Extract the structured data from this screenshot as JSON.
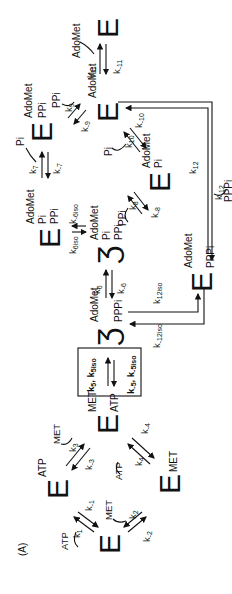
{
  "figure": {
    "panel_label": "(A)",
    "orientation": "rotated 90° counter-clockwise",
    "species": {
      "E_free": {
        "symbol": "E",
        "bound": []
      },
      "E_ATP": {
        "symbol": "E",
        "bound": [
          "ATP"
        ]
      },
      "E_MET": {
        "symbol": "E",
        "bound": [
          "MET"
        ]
      },
      "E_MET_ATP": {
        "symbol": "E",
        "bound": [
          "MET",
          "ATP"
        ]
      },
      "E_iso_AdoMet_PPPi": {
        "symbol": "Ʒ",
        "bound": [
          "AdoMet",
          "PPPi"
        ]
      },
      "E_AdoMet_PPPi": {
        "symbol": "E",
        "bound": [
          "AdoMet",
          "PPPi"
        ]
      },
      "E_AdoMet_Pi_PPi": {
        "symbol": "E",
        "bound": [
          "AdoMet",
          "Pi",
          "PPi"
        ]
      },
      "E_iso_AdoMet_Pi_PPi": {
        "symbol": "Ʒ",
        "bound": [
          "AdoMet",
          "Pi",
          "PPi"
        ]
      },
      "E_AdoMet_PPi": {
        "symbol": "E",
        "bound": [
          "AdoMet",
          "PPi"
        ]
      },
      "E_AdoMet_Pi": {
        "symbol": "E",
        "bound": [
          "AdoMet",
          "Pi"
        ]
      },
      "E_AdoMet": {
        "symbol": "E",
        "bound": [
          "AdoMet"
        ]
      },
      "E_final": {
        "symbol": "E",
        "bound": []
      }
    },
    "labels": {
      "ATP": "ATP",
      "MET": "MET",
      "AdoMet": "AdoMet",
      "Pi": "Pi",
      "PPi": "PPi",
      "PPPi": "PPPi",
      "k1": "k",
      "k1_sub": "1",
      "km1_sub": "-1",
      "k2_sub": "2",
      "km2_sub": "-2",
      "k3_sub": "3",
      "km3_sub": "-3",
      "k4_sub": "4",
      "km4_sub": "-4",
      "box_top": "k",
      "box_top_sub1": "5",
      "box_top_mid": ", k",
      "box_top_sub2": "5iso",
      "box_bot_sub1": "-5",
      "box_bot_sub2": "-5iso",
      "k6_sub": "6",
      "km6_sub": "-6",
      "k6iso_sub": "6iso",
      "km6iso_sub": "-6iso",
      "k7_sub": "7",
      "km7_sub": "-7",
      "k8_sub": "8",
      "km8_sub": "-8",
      "k9_sub": "9",
      "km9_sub": "-9",
      "k10_sub": "10",
      "km10_sub": "-10",
      "k11_sub": "11",
      "km11_sub": "-11",
      "k12_sub": "12",
      "km12_sub": "-12",
      "k12iso_sub": "12iso",
      "km12iso_sub": "-12iso"
    },
    "steps": [
      {
        "from": "E",
        "to": "E·ATP",
        "forward": "k1",
        "reverse": "k-1",
        "ligand": "ATP"
      },
      {
        "from": "E",
        "to": "E·MET",
        "forward": "k2",
        "reverse": "k-2",
        "ligand": "MET"
      },
      {
        "from": "E·ATP",
        "to": "E·MET·ATP",
        "forward": "k3",
        "reverse": "k-3",
        "ligand": "MET"
      },
      {
        "from": "E·MET",
        "to": "E·MET·ATP",
        "forward": "k4",
        "reverse": "k-4",
        "ligand": "ATP"
      },
      {
        "from": "E·MET·ATP",
        "to": "Eiso·AdoMet·PPPi",
        "forward": "k5, k5iso",
        "reverse": "k-5, k-5iso"
      },
      {
        "from": "Eiso·AdoMet·PPPi",
        "to": "Eiso·AdoMet·Pi·PPi",
        "forward": "k6",
        "reverse": "k-6"
      },
      {
        "from": "Eiso·AdoMet·Pi·PPi",
        "to": "E·AdoMet·Pi·PPi",
        "forward": "k6iso",
        "reverse": "k-6iso"
      },
      {
        "from": "E·AdoMet·Pi·PPi",
        "to": "E·AdoMet·PPi",
        "forward": "k7",
        "reverse": "k-7",
        "ligand": "Pi"
      },
      {
        "from": "Eiso·AdoMet·Pi·PPi",
        "to": "E·AdoMet·Pi",
        "forward": "k8",
        "reverse": "k-8",
        "ligand": "PPi"
      },
      {
        "from": "E·AdoMet·PPi",
        "to": "E·AdoMet",
        "forward": "k9",
        "reverse": "k-9",
        "ligand": "PPi"
      },
      {
        "from": "E·AdoMet·Pi",
        "to": "E·AdoMet",
        "forward": "k10",
        "reverse": "k-10",
        "ligand": "Pi"
      },
      {
        "from": "E·AdoMet",
        "to": "E",
        "forward": "k11",
        "reverse": "k-11",
        "ligand": "AdoMet"
      },
      {
        "from": "E·AdoMet",
        "to": "E·AdoMet·PPPi",
        "forward": "k12",
        "reverse": "k-12",
        "ligand": "PPPi"
      },
      {
        "from": "Eiso·AdoMet·PPPi",
        "to": "E·AdoMet·PPPi",
        "forward": "k12iso",
        "reverse": "k-12iso"
      }
    ]
  }
}
